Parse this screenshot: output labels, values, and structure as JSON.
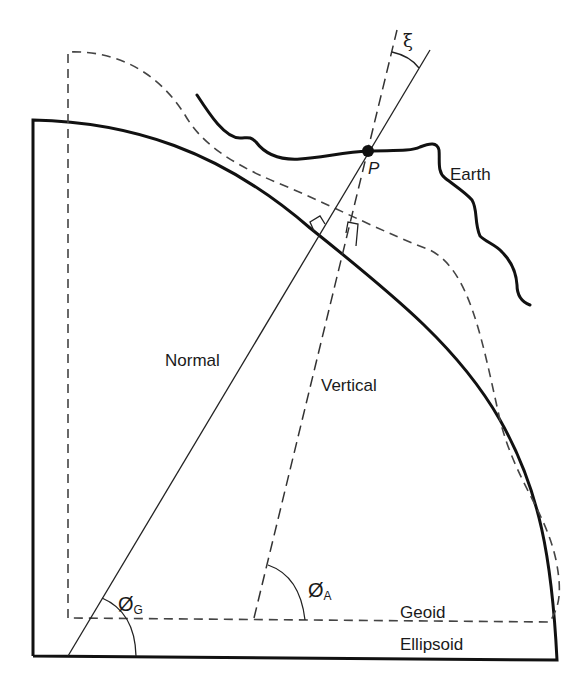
{
  "diagram": {
    "type": "geodesy-schematic",
    "labels": {
      "earth": "Earth",
      "point": "P",
      "deflection": "ξ",
      "normal": "Normal",
      "vertical": "Vertical",
      "geoid": "Geoid",
      "ellipsoid": "Ellipsoid",
      "geodetic_latitude_symbol": "Ø",
      "geodetic_latitude_sub": "G",
      "astronomic_latitude_symbol": "Ø",
      "astronomic_latitude_sub": "A"
    },
    "elements": [
      {
        "id": "ellipsoid",
        "style": "solid-thick"
      },
      {
        "id": "geoid",
        "style": "dashed"
      },
      {
        "id": "earth-surface",
        "style": "solid-thick-wavy"
      },
      {
        "id": "normal-line",
        "style": "solid-thin",
        "relation": "perpendicular to ellipsoid"
      },
      {
        "id": "vertical-line",
        "style": "dashed",
        "relation": "perpendicular to geoid"
      },
      {
        "id": "point-P",
        "style": "filled-dot"
      },
      {
        "id": "angle-xi",
        "between": [
          "normal-line",
          "vertical-line"
        ]
      },
      {
        "id": "angle-phi-G",
        "between": [
          "normal-line",
          "ellipsoid-base"
        ]
      },
      {
        "id": "angle-phi-A",
        "between": [
          "vertical-line",
          "geoid-base"
        ]
      }
    ],
    "colors": {
      "line": "#111111",
      "dash": "#444444",
      "text": "#1a1a1a",
      "background": "#ffffff"
    }
  }
}
